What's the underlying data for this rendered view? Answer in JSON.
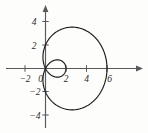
{
  "figure": {
    "title": "",
    "background_color": "#fdfdfc",
    "width": 148,
    "height": 133
  },
  "chart_data": {
    "type": "line",
    "title": "",
    "subtitle": "",
    "xlabel": "",
    "ylabel": "",
    "plot_kind": "polar-curve-cartesian-axes",
    "curve_name": "limacon-with-inner-loop",
    "polar_equation": "r = 2 + 4 cos(theta)",
    "xlim": [
      -3.2,
      7.6
    ],
    "ylim": [
      -5.1,
      5.2
    ],
    "grid": false,
    "legend": null,
    "legend_position": "none",
    "axis_style": "arrowed-cartesian-cross",
    "x_ticks": [
      -2,
      0,
      2,
      4,
      6
    ],
    "x_tick_labels": [
      "−2",
      "0",
      "2",
      "4",
      "6"
    ],
    "y_ticks": [
      -4,
      -2,
      2,
      4
    ],
    "y_tick_labels": [
      "−4",
      "−2",
      "2",
      "4"
    ],
    "key_points": {
      "outer_x_max": 6.0,
      "outer_y_max": 3.5,
      "outer_y_min": -3.5,
      "inner_loop_x_max": 2.0,
      "inner_loop_y_max": 0.62,
      "inner_loop_y_min": -0.62,
      "y_axis_crossing_upper": 2.2,
      "y_axis_crossing_lower": -2.2,
      "origin": [
        0,
        0
      ]
    },
    "series": [
      {
        "name": "r = 2 + 4 cos(theta)",
        "color": "#1a1a1a",
        "points_note": "traced for theta in [0, 2pi]; passes through origin at theta = 2pi/3 and 4pi/3 forming the inner loop",
        "x": [
          6.0,
          5.93,
          5.71,
          5.36,
          4.88,
          4.3,
          3.65,
          2.95,
          2.24,
          1.54,
          0.9,
          0.35,
          -0.07,
          -0.33,
          -0.42,
          -0.33,
          -0.07,
          0.35,
          0.9,
          1.54,
          2.24,
          2.95,
          3.65,
          4.3,
          4.88,
          5.36,
          5.71,
          5.93,
          6.0
        ],
        "y": [
          0.0,
          0.78,
          1.52,
          2.2,
          2.79,
          3.25,
          3.55,
          3.66,
          3.55,
          3.22,
          2.68,
          1.96,
          1.12,
          0.25,
          0.0,
          -0.25,
          -1.12,
          -1.96,
          -2.68,
          -3.22,
          -3.55,
          -3.66,
          -3.55,
          -3.25,
          -2.79,
          -2.2,
          -1.52,
          -0.78,
          0.0
        ],
        "inner_loop_x": [
          0.0,
          0.42,
          0.95,
          1.44,
          1.79,
          1.97,
          2.0,
          1.97,
          1.79,
          1.44,
          0.95,
          0.42,
          0.0
        ],
        "inner_loop_y": [
          0.0,
          0.36,
          0.56,
          0.62,
          0.52,
          0.3,
          0.0,
          -0.3,
          -0.52,
          -0.62,
          -0.56,
          -0.36,
          0.0
        ]
      }
    ]
  },
  "axes": {
    "x_axis_name": "horizontal-axis",
    "y_axis_name": "vertical-axis",
    "tick_labels_x": [
      {
        "text": "−2",
        "value": -2
      },
      {
        "text": "0",
        "value": 0
      },
      {
        "text": "2",
        "value": 2
      },
      {
        "text": "4",
        "value": 4
      },
      {
        "text": "6",
        "value": 6
      }
    ],
    "tick_labels_y": [
      {
        "text": "4",
        "value": 4
      },
      {
        "text": "2",
        "value": 2
      },
      {
        "text": "−2",
        "value": -2
      },
      {
        "text": "−4",
        "value": -4
      }
    ]
  },
  "colors": {
    "curve": "#1a1a1a",
    "axis": "#59595c",
    "text": "#2b2b2b",
    "background": "#fdfdfc"
  }
}
